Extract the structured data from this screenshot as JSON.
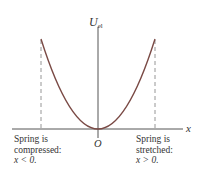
{
  "diagram": {
    "title_cropped": "",
    "y_axis_label": "U",
    "y_axis_label_subscript": "el",
    "x_axis_label": "x",
    "origin_label": "O",
    "left_caption": [
      "Spring is",
      "compressed:",
      "x < 0."
    ],
    "right_caption": [
      "Spring is",
      "stretched:",
      "x > 0."
    ],
    "curve": "parabola U_el = ½kx²",
    "colors": {
      "curve": "#7a4a45",
      "axes": "#555555",
      "dashed": "#8a8a8a",
      "text": "#333333"
    }
  }
}
